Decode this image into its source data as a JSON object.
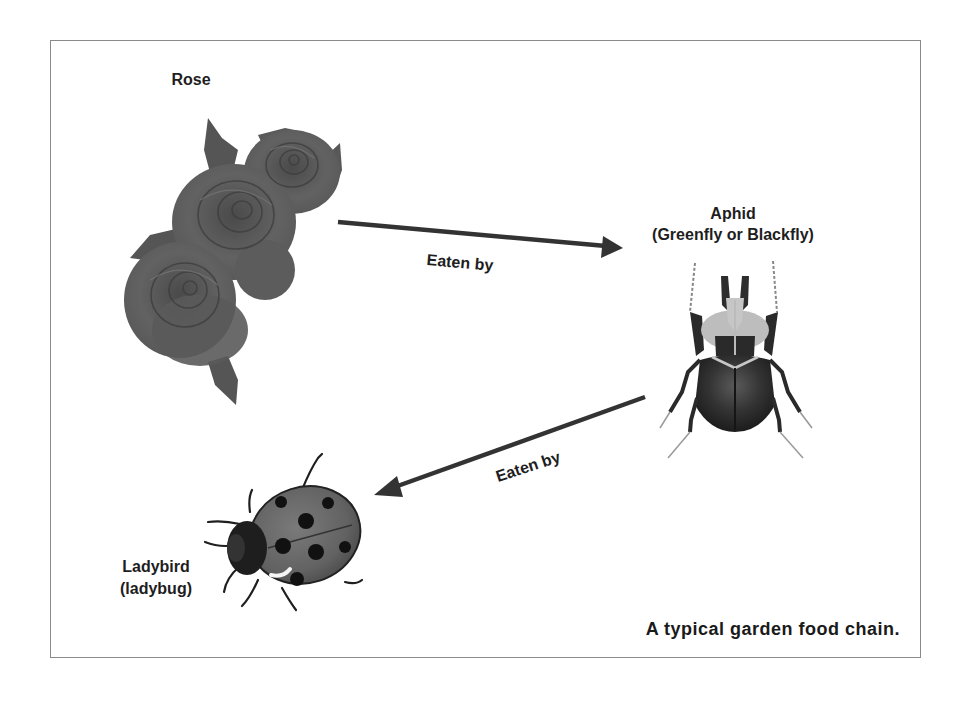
{
  "diagram": {
    "type": "food-chain",
    "caption": "A typical garden food chain.",
    "nodes": [
      {
        "id": "rose",
        "label": "Rose",
        "icon": "rose-icon"
      },
      {
        "id": "aphid",
        "label": "Aphid",
        "sublabel": "(Greenfly or Blackfly)",
        "icon": "beetle-icon"
      },
      {
        "id": "ladybird",
        "label": "Ladybird",
        "sublabel": "(ladybug)",
        "icon": "ladybug-icon"
      }
    ],
    "edges": [
      {
        "from": "rose",
        "to": "aphid",
        "label": "Eaten by"
      },
      {
        "from": "aphid",
        "to": "ladybird",
        "label": "Eaten by"
      }
    ]
  },
  "colors": {
    "border": "#8a8a8a",
    "text": "#1e1e1e",
    "arrow": "#333333",
    "rose": "#5e5e5e",
    "beetle": "#2a2a2a",
    "ladybug_shell": "#6a6a6a",
    "spots": "#111111"
  }
}
